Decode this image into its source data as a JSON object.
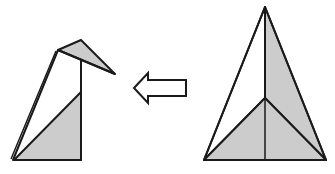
{
  "diagram": {
    "colors": {
      "background": "#ffffff",
      "stroke": "#1a1a1a",
      "shade": "#cccccc",
      "paper": "#ffffff"
    },
    "figures": [
      {
        "id": "result",
        "description": "Folded origami bird/penguin shape with head and beak"
      },
      {
        "id": "arrow",
        "description": "Hollow arrow pointing left indicating transformation direction"
      },
      {
        "id": "start",
        "description": "Tall triangular origami base with inner folds"
      }
    ]
  }
}
